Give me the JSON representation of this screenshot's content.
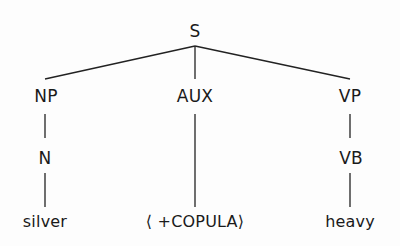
{
  "diagram": {
    "type": "syntax-tree",
    "root": {
      "label": "S",
      "children": [
        {
          "label": "NP",
          "children": [
            {
              "label": "N",
              "children": [
                {
                  "label": "silver"
                }
              ]
            }
          ]
        },
        {
          "label": "AUX",
          "children": [
            {
              "label": "⟨ +COPULA⟩"
            }
          ]
        },
        {
          "label": "VP",
          "children": [
            {
              "label": "VB",
              "children": [
                {
                  "label": "heavy"
                }
              ]
            }
          ]
        }
      ]
    },
    "nodes": {
      "s": "S",
      "np": "NP",
      "aux": "AUX",
      "vp": "VP",
      "n": "N",
      "vb": "VB",
      "silver": "silver",
      "copula": "⟨ +COPULA⟩",
      "heavy": "heavy"
    },
    "colors": {
      "ink": "#1a1a1a",
      "background": "#fdfdfd"
    }
  }
}
